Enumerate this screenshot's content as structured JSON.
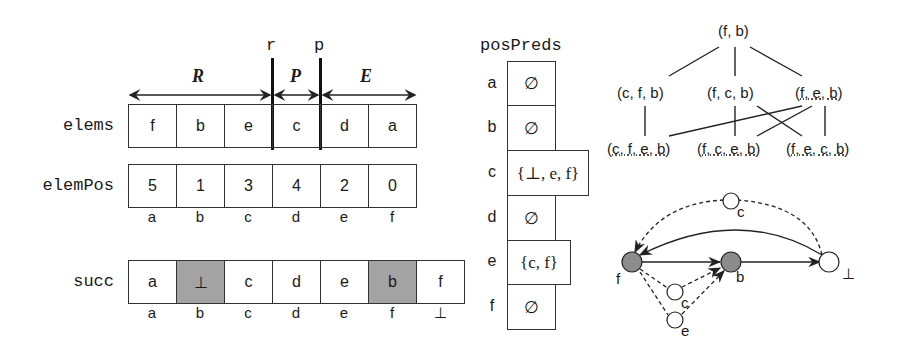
{
  "markers": {
    "r": "r",
    "p": "p"
  },
  "regions": {
    "R": "R",
    "P": "P",
    "E": "E"
  },
  "elems": {
    "label": "elems",
    "cells": [
      "f",
      "b",
      "e",
      "c",
      "d",
      "a"
    ]
  },
  "elemPos": {
    "label": "elemPos",
    "cells": [
      "5",
      "1",
      "3",
      "4",
      "2",
      "0"
    ],
    "index": [
      "a",
      "b",
      "c",
      "d",
      "e",
      "f"
    ]
  },
  "succ": {
    "label": "succ",
    "cells": [
      "a",
      "⊥",
      "c",
      "d",
      "e",
      "b",
      "f"
    ],
    "shaded": [
      1,
      5
    ],
    "index": [
      "a",
      "b",
      "c",
      "d",
      "e",
      "f",
      "⊥"
    ]
  },
  "posPreds": {
    "title": "posPreds",
    "rows": [
      {
        "key": "a",
        "value": "∅"
      },
      {
        "key": "b",
        "value": "∅"
      },
      {
        "key": "c",
        "value": "{⊥, e, f}"
      },
      {
        "key": "d",
        "value": "∅"
      },
      {
        "key": "e",
        "value": "{c, f}"
      },
      {
        "key": "f",
        "value": "∅"
      }
    ]
  },
  "lattice": {
    "root": "(f, b)",
    "level1": [
      "(c, f, b)",
      "(f, c, b)",
      "(f, e, b)"
    ],
    "level2": [
      "(c, f, e, b)",
      "(f, c, e, b)",
      "(f, e, c, b)"
    ]
  },
  "graph": {
    "nodes": [
      {
        "id": "f",
        "label": "f",
        "filled": true
      },
      {
        "id": "b",
        "label": "b",
        "filled": true
      },
      {
        "id": "bot",
        "label": "⊥",
        "filled": false
      },
      {
        "id": "c_top",
        "label": "c",
        "filled": false
      },
      {
        "id": "c_mid",
        "label": "c",
        "filled": false
      },
      {
        "id": "e",
        "label": "e",
        "filled": false
      }
    ],
    "colors": {
      "filled": "#8c8c8c",
      "edge": "#222222"
    }
  }
}
